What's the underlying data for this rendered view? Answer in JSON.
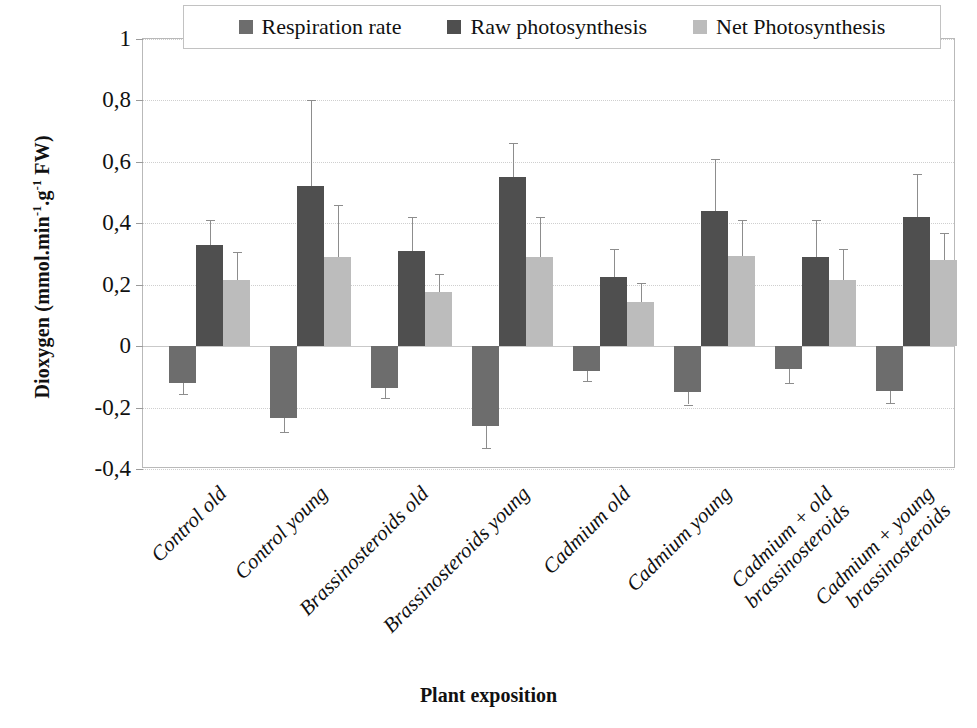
{
  "chart_data": {
    "type": "bar",
    "title": "",
    "xlabel": "Plant exposition",
    "ylabel": "Dioxygen (mmol.min-1.g-1 FW)",
    "ylabel_parts": {
      "base": "Dioxygen (mmol.min",
      "sup1": "-1",
      "mid": ".g",
      "sup2": "-1",
      "tail": " FW)"
    },
    "ylim": [
      -0.4,
      1
    ],
    "ytick_labels": [
      "1",
      "0,8",
      "0,6",
      "0,4",
      "0,2",
      "0",
      "-0,2",
      "-0,4"
    ],
    "ytick_values": [
      1,
      0.8,
      0.6,
      0.4,
      0.2,
      0,
      -0.2,
      -0.4
    ],
    "grid": true,
    "legend_position": "top",
    "decimal_separator": ",",
    "categories": [
      "Control old",
      "Control young",
      "Brassinosteroids old",
      "Brassinosteroids young",
      "Cadmium old",
      "Cadmium young",
      "Cadmium + brassinosteroids old",
      "Cadmium + brassinosteroids young"
    ],
    "categories_wrapped": [
      [
        "Control old",
        ""
      ],
      [
        "Control young",
        ""
      ],
      [
        "Brassinosteroids old",
        ""
      ],
      [
        "Brassinosteroids young",
        ""
      ],
      [
        "Cadmium old",
        ""
      ],
      [
        "Cadmium young",
        ""
      ],
      [
        "Cadmium +  old",
        "brassinosteroids"
      ],
      [
        "Cadmium +  young",
        "brassinosteroids"
      ]
    ],
    "series": [
      {
        "name": "Respiration rate",
        "color": "#6d6d6d",
        "values": [
          -0.12,
          -0.235,
          -0.135,
          -0.26,
          -0.08,
          -0.15,
          -0.075,
          -0.145
        ],
        "errors": [
          0.035,
          0.045,
          0.035,
          0.07,
          0.035,
          0.04,
          0.045,
          0.04
        ]
      },
      {
        "name": "Raw photosynthesis",
        "color": "#4f4f4f",
        "values": [
          0.33,
          0.52,
          0.31,
          0.55,
          0.225,
          0.44,
          0.29,
          0.42
        ],
        "errors": [
          0.08,
          0.28,
          0.11,
          0.11,
          0.09,
          0.17,
          0.12,
          0.14
        ]
      },
      {
        "name": "Net Photosynthesis",
        "color": "#bcbcbc",
        "values": [
          0.215,
          0.29,
          0.175,
          0.29,
          0.145,
          0.295,
          0.215,
          0.28
        ],
        "errors": [
          0.09,
          0.17,
          0.06,
          0.13,
          0.06,
          0.115,
          0.1,
          0.09
        ]
      }
    ]
  }
}
